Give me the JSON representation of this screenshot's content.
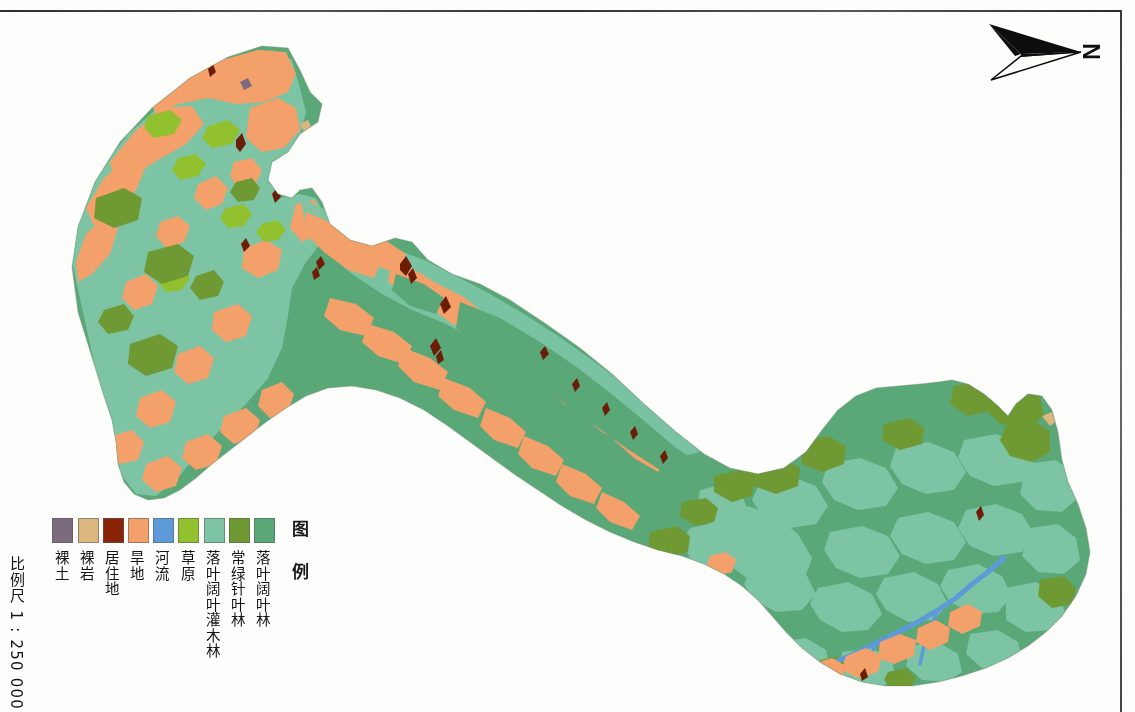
{
  "document": {
    "type": "thematic-vegetation-map",
    "orientation_note": "map sheet scanned sideways; legend and annotations are rotated 90 degrees"
  },
  "north_arrow": {
    "label": "N",
    "icon": "north-arrow-icon",
    "points_direction": "right"
  },
  "legend": {
    "title": "图 例",
    "items": [
      {
        "label": "落叶阔叶林",
        "color": "#5aa777"
      },
      {
        "label": "常绿针叶林",
        "color": "#6f9a33"
      },
      {
        "label": "落叶阔叶灌木林",
        "color": "#7cc4a4"
      },
      {
        "label": "草原",
        "color": "#92c12f"
      },
      {
        "label": "河流",
        "color": "#5d9bd8"
      },
      {
        "label": "旱地",
        "color": "#f4a06a"
      },
      {
        "label": "居住地",
        "color": "#8a2408"
      },
      {
        "label": "裸岩",
        "color": "#d9b77e"
      },
      {
        "label": "裸土",
        "color": "#7b6b7d"
      }
    ]
  },
  "scale": {
    "text": "比例尺  1 : 250 000",
    "ratio": "1:250000"
  },
  "map_colors": {
    "deciduous_broadleaf_forest": "#5aa777",
    "evergreen_coniferous_forest": "#6f9a33",
    "deciduous_broadleaf_shrub": "#7cc4a4",
    "grassland": "#92c12f",
    "river": "#5d9bd8",
    "dryland": "#f4a06a",
    "residential": "#8a2408",
    "bare_rock": "#d9b77e",
    "bare_soil": "#7b6b7d",
    "background": "#fdfdfb"
  }
}
